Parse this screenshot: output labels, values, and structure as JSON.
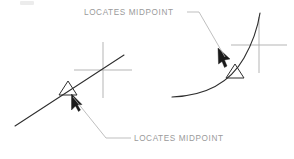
{
  "figure": {
    "background_color": "#ffffff",
    "line_color": "#2e2e2e",
    "crosshair_color": "#a8a8a8",
    "leader_color": "#aeaeae",
    "text_color": "#9a9a9a"
  },
  "annotations": {
    "top_label": "LOCATES  MIDPOINT",
    "bottom_label": "LOCATES  MIDPOINT"
  },
  "panels": [
    {
      "id": "left-panel",
      "name": "midpoint-on-line",
      "object_type": "line",
      "snap_marker": "triangle",
      "snap_mode": "MIDPOINT",
      "label": "LOCATES  MIDPOINT",
      "label_position": "bottom"
    },
    {
      "id": "right-panel",
      "name": "midpoint-on-arc",
      "object_type": "arc",
      "snap_marker": "triangle",
      "snap_mode": "MIDPOINT",
      "label": "LOCATES  MIDPOINT",
      "label_position": "top"
    }
  ]
}
